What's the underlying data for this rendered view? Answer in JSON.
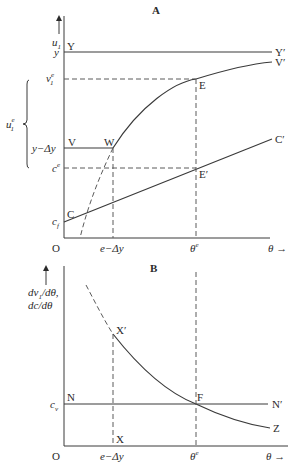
{
  "panel_a": {
    "title": "A",
    "y_axis_label": "u",
    "y_axis_label_sub": "1",
    "brace_label": "u",
    "brace_label_sup": "e",
    "brace_label_sub": "1",
    "x_axis_label": "θ",
    "origin": "O",
    "ticks_y": {
      "y": "y",
      "v1e": "v",
      "v1e_sup": "e",
      "v1e_sub": "1",
      "y_minus_dy": "y−Δy",
      "ce": "c",
      "ce_sup": "e",
      "cf": "c",
      "cf_sub": "f"
    },
    "ticks_x": {
      "e_minus_dy": "e−Δy",
      "theta_e": "θ",
      "theta_e_sup": "e"
    },
    "points": {
      "Y": "Y",
      "Y_prime": "Y′",
      "V": "V",
      "V_prime": "V′",
      "W": "W",
      "E": "E",
      "E_prime": "E′",
      "C": "C",
      "C_prime": "C′"
    }
  },
  "panel_b": {
    "title": "B",
    "y_axis_label_1": "dv",
    "y_axis_label_1_sub": "1",
    "y_axis_label_1_rest": "/dθ,",
    "y_axis_label_2": "dc/dθ",
    "x_axis_label": "θ",
    "origin": "O",
    "ticks_y": {
      "cv": "c",
      "cv_sub": "v"
    },
    "ticks_x": {
      "e_minus_dy": "e−Δy",
      "theta_e": "θ",
      "theta_e_sup": "e"
    },
    "points": {
      "N": "N",
      "N_prime": "N′",
      "X": "X",
      "X_prime": "X′",
      "F": "F",
      "Z": "Z"
    }
  },
  "arrow": "→"
}
